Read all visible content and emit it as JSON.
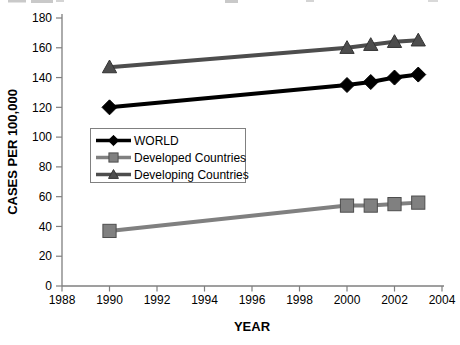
{
  "chart_data": {
    "type": "line",
    "title": "",
    "xlabel": "YEAR",
    "ylabel": "CASES PER 100,000",
    "xlim": [
      1988,
      2004
    ],
    "ylim": [
      0,
      180
    ],
    "x_ticks": [
      1988,
      1990,
      1992,
      1994,
      1996,
      1998,
      2000,
      2002,
      2004
    ],
    "y_ticks": [
      0,
      20,
      40,
      60,
      80,
      100,
      120,
      140,
      160,
      180
    ],
    "grid": false,
    "plot_background": "#ffffff",
    "axis_color": "#7f7f7f",
    "legend_position": "inside-left",
    "legend_border_color": "#808080",
    "series": [
      {
        "name": "WORLD",
        "marker": "diamond",
        "color": "#000000",
        "marker_border": "#000000",
        "x": [
          1990,
          2000,
          2001,
          2002,
          2003
        ],
        "y": [
          120,
          135,
          137,
          140,
          142
        ]
      },
      {
        "name": "Developed Countries",
        "marker": "square",
        "color": "#808080",
        "marker_border": "#4d4d4d",
        "x": [
          1990,
          2000,
          2001,
          2002,
          2003
        ],
        "y": [
          37,
          54,
          54,
          55,
          56
        ]
      },
      {
        "name": "Developing Countries",
        "marker": "triangle",
        "color": "#4d4d4d",
        "marker_border": "#333333",
        "x": [
          1990,
          2000,
          2001,
          2002,
          2003
        ],
        "y": [
          147,
          160,
          162,
          164,
          165
        ]
      }
    ]
  }
}
